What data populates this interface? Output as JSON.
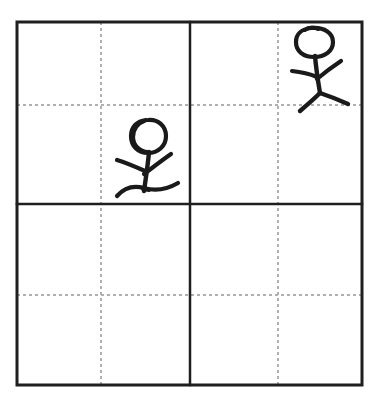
{
  "page": {
    "width": 381,
    "height": 406,
    "background_color": "#ffffff"
  },
  "colors": {
    "ink": "#1a1a1a",
    "frame_border": "#1f1f1f",
    "guide_dotted": "#b0b0b0",
    "paper": "#ffffff"
  },
  "grid": {
    "type": "storyboard-grid",
    "columns": 2,
    "rows": 2,
    "frame": {
      "x": 17,
      "y": 22,
      "width": 345,
      "height": 363
    },
    "solid_divider_vertical_x": 190,
    "solid_divider_horizontal_y": 204,
    "border_width_px": 3,
    "divider_width_px": 2,
    "guides": {
      "style": "dotted",
      "width_px": 2,
      "vertical_x": [
        101,
        278
      ],
      "horizontal_y": [
        105,
        295
      ]
    },
    "cells": [
      {
        "id": "cell-top-left",
        "row": 1,
        "col": 1,
        "contents": "stick-figure-left",
        "empty": false
      },
      {
        "id": "cell-top-right",
        "row": 1,
        "col": 2,
        "contents": "stick-figure-right",
        "empty": false
      },
      {
        "id": "cell-bottom-left",
        "row": 2,
        "col": 1,
        "contents": "",
        "empty": true
      },
      {
        "id": "cell-bottom-right",
        "row": 2,
        "col": 2,
        "contents": "",
        "empty": true
      }
    ]
  },
  "figures": [
    {
      "id": "stick-figure-left",
      "name": "stick-figure-left",
      "cell": "cell-top-left",
      "description": "Stick figure with spiral-looped head standing on a wavy ground line, right arm raised",
      "stroke_width": 4,
      "head": {
        "shape": "spiral-circle",
        "center_x": 148,
        "center_y": 136,
        "radius_x": 17,
        "radius_y": 16
      },
      "body": {
        "x1": 148,
        "y1": 152,
        "x2": 144,
        "y2": 190
      },
      "arms": [
        {
          "name": "arm-left-down",
          "x1": 144,
          "y1": 170,
          "x2": 118,
          "y2": 160
        },
        {
          "name": "arm-right-up",
          "x1": 145,
          "y1": 172,
          "x2": 170,
          "y2": 155
        }
      ],
      "ground_line": {
        "name": "wavy-ground",
        "points": "118,194 130,186 146,189 162,188 178,183"
      }
    },
    {
      "id": "stick-figure-right",
      "name": "stick-figure-right",
      "cell": "cell-top-right",
      "description": "Stick figure with oval head, arms out and legs spread in a walking stance",
      "stroke_width": 4,
      "head": {
        "shape": "oval",
        "center_x": 315,
        "center_y": 42,
        "radius_x": 18,
        "radius_y": 14
      },
      "body": {
        "x1": 316,
        "y1": 56,
        "x2": 320,
        "y2": 93
      },
      "arms": [
        {
          "name": "arm-left-out",
          "x1": 317,
          "y1": 76,
          "x2": 293,
          "y2": 72
        },
        {
          "name": "arm-right-up",
          "x1": 318,
          "y1": 78,
          "x2": 340,
          "y2": 62
        }
      ],
      "legs": [
        {
          "name": "leg-left",
          "x1": 320,
          "y1": 93,
          "x2": 301,
          "y2": 110
        },
        {
          "name": "leg-right",
          "x1": 320,
          "y1": 93,
          "x2": 347,
          "y2": 103
        }
      ]
    }
  ]
}
